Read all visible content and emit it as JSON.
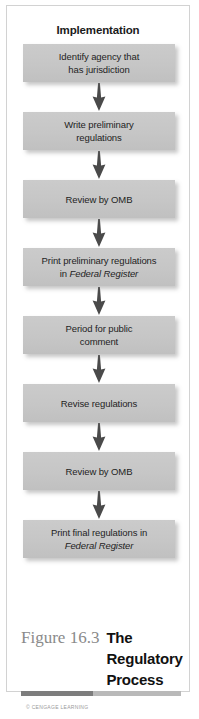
{
  "figure": {
    "diagram_title": "Implementation",
    "caption_number": "Figure 16.3",
    "caption_title": "The Regulatory Process",
    "credit": "© CENGAGE LEARNING"
  },
  "colors": {
    "node_fill": "#c6c6c6",
    "node_text": "#1e1e1e",
    "arrow": "#4a4a4a",
    "frame_border": "#d2d2d2",
    "caption_number": "#8a8a8a",
    "caption_title": "#111111",
    "rule_dark": "#7d7d7d",
    "rule_light": "#b9b9b9",
    "background": "#ffffff"
  },
  "chart_data": {
    "type": "flowchart",
    "title": "Implementation",
    "orientation": "vertical",
    "connector": "down-arrow",
    "node_count": 8,
    "nodes": [
      {
        "step": 1,
        "lines": [
          "Identify agency that",
          "has jurisdiction"
        ],
        "italic_lines": []
      },
      {
        "step": 2,
        "lines": [
          "Write preliminary",
          "regulations"
        ],
        "italic_lines": []
      },
      {
        "step": 3,
        "lines": [
          "Review by OMB"
        ],
        "italic_lines": []
      },
      {
        "step": 4,
        "lines": [
          "Print preliminary regulations",
          "in Federal Register"
        ],
        "italic_lines": [
          "Federal Register"
        ]
      },
      {
        "step": 5,
        "lines": [
          "Period for public",
          "comment"
        ],
        "italic_lines": []
      },
      {
        "step": 6,
        "lines": [
          "Revise regulations"
        ],
        "italic_lines": []
      },
      {
        "step": 7,
        "lines": [
          "Review by OMB"
        ],
        "italic_lines": []
      },
      {
        "step": 8,
        "lines": [
          "Print final regulations in",
          "Federal Register"
        ],
        "italic_lines": [
          "Federal Register"
        ]
      }
    ]
  }
}
